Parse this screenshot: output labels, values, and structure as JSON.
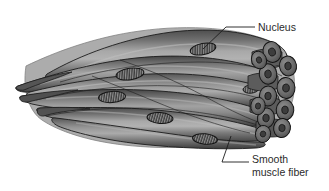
{
  "figure": {
    "background_color": "#ffffff",
    "width": 329,
    "height": 191
  },
  "palette": {
    "fiber_dark": "#4a4a4a",
    "fiber_mid": "#6f6f6f",
    "fiber_light": "#9a9a9a",
    "fiber_highlight": "#b5b5b5",
    "outline": "#1c1c1c",
    "nucleus_fill": "#3a3a3a",
    "nucleus_stroke": "#141414",
    "cross_section_fill": "#6b6b6b",
    "cross_section_ring": "#3d3d3d",
    "leader_line": "#1c1c1c",
    "text_color": "#2b2b2b"
  },
  "labels": {
    "nucleus": {
      "text": "Nucleus",
      "lines": [
        "Nucleus"
      ],
      "x": 258,
      "y": 30,
      "leader_from": [
        203,
        49
      ],
      "leader_to": [
        255,
        26
      ]
    },
    "smooth_muscle_fiber": {
      "text": "Smooth muscle fiber",
      "lines": [
        "Smooth",
        "muscle fiber"
      ],
      "x": 252,
      "y": 163,
      "leader_from": [
        231,
        136
      ],
      "leader_to": [
        249,
        166
      ]
    }
  },
  "structures": {
    "longitudinal_fibers_count": 8,
    "nuclei_count": 6,
    "cross_section_tubes_count": 11,
    "nucleus_positions": [
      [
        203,
        49
      ],
      [
        130,
        73
      ],
      [
        113,
        97
      ],
      [
        160,
        117
      ],
      [
        205,
        138
      ],
      [
        252,
        89
      ]
    ]
  }
}
